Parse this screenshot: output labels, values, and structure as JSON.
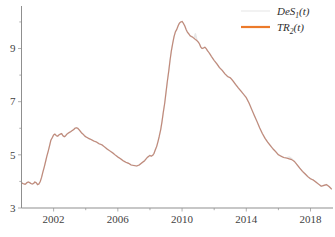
{
  "chart_data": {
    "type": "line",
    "title": "",
    "xlabel": "",
    "ylabel": "",
    "xlim": [
      2000.0,
      2019.4
    ],
    "ylim": [
      3,
      10.6
    ],
    "grid": false,
    "xticks": [
      2002,
      2006,
      2010,
      2014,
      2018
    ],
    "xticklabels": [
      "2002",
      "2006",
      "2010",
      "2014",
      "2018"
    ],
    "xminorticks": [
      2004,
      2008,
      2012,
      2016
    ],
    "yticks": [
      3,
      5,
      7,
      9
    ],
    "yticklabels": [
      "3",
      "5",
      "7",
      "9"
    ],
    "yminorticks": [
      4,
      6,
      8,
      10
    ],
    "legend": {
      "position": "top-right",
      "entries": [
        {
          "name": "DeS",
          "sub": "1",
          "arg": "(t)",
          "color": "#e8e8e8",
          "width": 1.1
        },
        {
          "name": "TR",
          "sub": "2",
          "arg": "(t)",
          "color": "#ec7a2a",
          "width": 2.2
        }
      ]
    },
    "series": [
      {
        "name": "DeS1(t)",
        "color": "#e8e8e8",
        "x": [
          2000.0,
          2000.08,
          2000.17,
          2000.25,
          2000.33,
          2000.42,
          2000.5,
          2000.58,
          2000.67,
          2000.75,
          2000.83,
          2000.92,
          2001.0,
          2001.08,
          2001.17,
          2001.25,
          2001.33,
          2001.42,
          2001.5,
          2001.58,
          2001.67,
          2001.75,
          2001.83,
          2001.92,
          2002.0,
          2002.08,
          2002.17,
          2002.25,
          2002.33,
          2002.42,
          2002.5,
          2002.58,
          2002.67,
          2002.75,
          2002.83,
          2002.92,
          2003.0,
          2003.08,
          2003.17,
          2003.25,
          2003.33,
          2003.42,
          2003.5,
          2003.58,
          2003.67,
          2003.75,
          2003.83,
          2003.92,
          2004.0,
          2004.17,
          2004.33,
          2004.5,
          2004.67,
          2004.83,
          2005.0,
          2005.17,
          2005.33,
          2005.5,
          2005.67,
          2005.83,
          2006.0,
          2006.17,
          2006.33,
          2006.5,
          2006.67,
          2006.83,
          2007.0,
          2007.17,
          2007.33,
          2007.5,
          2007.67,
          2007.83,
          2008.0,
          2008.08,
          2008.17,
          2008.25,
          2008.33,
          2008.42,
          2008.5,
          2008.58,
          2008.67,
          2008.75,
          2008.83,
          2008.92,
          2009.0,
          2009.08,
          2009.17,
          2009.25,
          2009.33,
          2009.42,
          2009.5,
          2009.58,
          2009.67,
          2009.75,
          2009.83,
          2009.92,
          2010.0,
          2010.08,
          2010.17,
          2010.25,
          2010.33,
          2010.42,
          2010.5,
          2010.58,
          2010.67,
          2010.75,
          2010.83,
          2010.92,
          2011.0,
          2011.08,
          2011.17,
          2011.25,
          2011.33,
          2011.42,
          2011.5,
          2011.58,
          2011.67,
          2011.75,
          2011.83,
          2011.92,
          2012.0,
          2012.17,
          2012.33,
          2012.5,
          2012.67,
          2012.83,
          2013.0,
          2013.08,
          2013.17,
          2013.33,
          2013.5,
          2013.67,
          2013.83,
          2014.0,
          2014.17,
          2014.33,
          2014.5,
          2014.67,
          2014.83,
          2015.0,
          2015.17,
          2015.33,
          2015.5,
          2015.67,
          2015.83,
          2016.0,
          2016.17,
          2016.33,
          2016.5,
          2016.67,
          2016.83,
          2017.0,
          2017.17,
          2017.33,
          2017.5,
          2017.67,
          2017.83,
          2018.0,
          2018.17,
          2018.33,
          2018.5,
          2018.67,
          2018.83,
          2019.0,
          2019.17,
          2019.3
        ],
        "y": [
          3.95,
          3.92,
          3.9,
          3.9,
          3.95,
          3.98,
          3.96,
          3.92,
          3.9,
          3.92,
          3.98,
          3.95,
          3.88,
          3.9,
          4.0,
          4.15,
          4.35,
          4.55,
          4.75,
          4.95,
          5.15,
          5.35,
          5.55,
          5.65,
          5.75,
          5.78,
          5.72,
          5.7,
          5.75,
          5.78,
          5.8,
          5.72,
          5.68,
          5.72,
          5.78,
          5.82,
          5.85,
          5.88,
          5.92,
          5.95,
          6.0,
          6.02,
          6.0,
          5.95,
          5.88,
          5.82,
          5.78,
          5.72,
          5.68,
          5.62,
          5.58,
          5.52,
          5.48,
          5.42,
          5.38,
          5.3,
          5.22,
          5.15,
          5.08,
          5.0,
          4.92,
          4.85,
          4.78,
          4.72,
          4.68,
          4.62,
          4.6,
          4.58,
          4.62,
          4.7,
          4.78,
          4.9,
          4.98,
          4.95,
          4.98,
          5.05,
          5.18,
          5.32,
          5.5,
          5.7,
          5.95,
          6.25,
          6.6,
          6.95,
          7.35,
          7.75,
          8.15,
          8.55,
          8.9,
          9.2,
          9.45,
          9.62,
          9.72,
          9.85,
          9.95,
          10.0,
          10.02,
          9.95,
          9.85,
          9.72,
          9.62,
          9.55,
          9.48,
          9.45,
          9.42,
          9.38,
          9.55,
          9.32,
          9.25,
          9.18,
          9.05,
          9.0,
          9.02,
          9.05,
          9.0,
          8.92,
          8.85,
          8.78,
          8.7,
          8.62,
          8.55,
          8.42,
          8.28,
          8.18,
          8.05,
          7.95,
          7.9,
          7.85,
          7.78,
          7.65,
          7.52,
          7.4,
          7.28,
          7.15,
          6.95,
          6.72,
          6.48,
          6.25,
          6.02,
          5.8,
          5.62,
          5.48,
          5.35,
          5.22,
          5.12,
          5.0,
          4.95,
          4.9,
          4.88,
          4.92,
          4.85,
          4.75,
          4.62,
          4.5,
          4.38,
          4.28,
          4.18,
          4.1,
          4.05,
          3.98,
          3.9,
          3.82,
          3.85,
          3.88,
          3.8,
          3.72
        ]
      },
      {
        "name": "TR2(t)",
        "color": "#c08878",
        "x": [
          2000.0,
          2000.08,
          2000.17,
          2000.25,
          2000.33,
          2000.42,
          2000.5,
          2000.58,
          2000.67,
          2000.75,
          2000.83,
          2000.92,
          2001.0,
          2001.08,
          2001.17,
          2001.25,
          2001.33,
          2001.42,
          2001.5,
          2001.58,
          2001.67,
          2001.75,
          2001.83,
          2001.92,
          2002.0,
          2002.08,
          2002.17,
          2002.25,
          2002.33,
          2002.42,
          2002.5,
          2002.58,
          2002.67,
          2002.75,
          2002.83,
          2002.92,
          2003.0,
          2003.08,
          2003.17,
          2003.25,
          2003.33,
          2003.42,
          2003.5,
          2003.58,
          2003.67,
          2003.75,
          2003.83,
          2003.92,
          2004.0,
          2004.17,
          2004.33,
          2004.5,
          2004.67,
          2004.83,
          2005.0,
          2005.17,
          2005.33,
          2005.5,
          2005.67,
          2005.83,
          2006.0,
          2006.17,
          2006.33,
          2006.5,
          2006.67,
          2006.83,
          2007.0,
          2007.17,
          2007.33,
          2007.5,
          2007.67,
          2007.83,
          2008.0,
          2008.08,
          2008.17,
          2008.25,
          2008.33,
          2008.42,
          2008.5,
          2008.58,
          2008.67,
          2008.75,
          2008.83,
          2008.92,
          2009.0,
          2009.08,
          2009.17,
          2009.25,
          2009.33,
          2009.42,
          2009.5,
          2009.58,
          2009.67,
          2009.75,
          2009.83,
          2009.92,
          2010.0,
          2010.08,
          2010.17,
          2010.25,
          2010.33,
          2010.42,
          2010.5,
          2010.58,
          2010.67,
          2010.75,
          2010.83,
          2010.92,
          2011.0,
          2011.08,
          2011.17,
          2011.25,
          2011.33,
          2011.42,
          2011.5,
          2011.58,
          2011.67,
          2011.75,
          2011.83,
          2011.92,
          2012.0,
          2012.17,
          2012.33,
          2012.5,
          2012.67,
          2012.83,
          2013.0,
          2013.08,
          2013.17,
          2013.33,
          2013.5,
          2013.67,
          2013.83,
          2014.0,
          2014.17,
          2014.33,
          2014.5,
          2014.67,
          2014.83,
          2015.0,
          2015.17,
          2015.33,
          2015.5,
          2015.67,
          2015.83,
          2016.0,
          2016.17,
          2016.33,
          2016.5,
          2016.67,
          2016.83,
          2017.0,
          2017.17,
          2017.33,
          2017.5,
          2017.67,
          2017.83,
          2018.0,
          2018.17,
          2018.33,
          2018.5,
          2018.67,
          2018.83,
          2019.0,
          2019.17,
          2019.3
        ],
        "y": [
          3.95,
          3.92,
          3.9,
          3.9,
          3.95,
          3.98,
          3.96,
          3.92,
          3.9,
          3.92,
          3.98,
          3.95,
          3.88,
          3.9,
          4.0,
          4.15,
          4.35,
          4.55,
          4.75,
          4.95,
          5.15,
          5.35,
          5.55,
          5.65,
          5.75,
          5.78,
          5.72,
          5.7,
          5.75,
          5.78,
          5.8,
          5.72,
          5.68,
          5.72,
          5.78,
          5.82,
          5.85,
          5.88,
          5.92,
          5.95,
          6.0,
          6.02,
          6.0,
          5.95,
          5.88,
          5.82,
          5.78,
          5.72,
          5.68,
          5.62,
          5.58,
          5.52,
          5.48,
          5.42,
          5.38,
          5.3,
          5.22,
          5.15,
          5.08,
          5.0,
          4.92,
          4.85,
          4.78,
          4.72,
          4.68,
          4.62,
          4.6,
          4.58,
          4.62,
          4.7,
          4.78,
          4.9,
          4.98,
          4.95,
          4.98,
          5.05,
          5.18,
          5.32,
          5.5,
          5.7,
          5.95,
          6.25,
          6.6,
          6.95,
          7.35,
          7.75,
          8.15,
          8.55,
          8.9,
          9.2,
          9.45,
          9.62,
          9.72,
          9.85,
          9.95,
          10.0,
          10.02,
          9.95,
          9.85,
          9.72,
          9.62,
          9.55,
          9.48,
          9.45,
          9.42,
          9.38,
          9.34,
          9.3,
          9.25,
          9.18,
          9.05,
          9.0,
          9.02,
          9.05,
          9.0,
          8.92,
          8.85,
          8.78,
          8.7,
          8.62,
          8.55,
          8.42,
          8.28,
          8.18,
          8.05,
          7.95,
          7.9,
          7.85,
          7.78,
          7.65,
          7.52,
          7.4,
          7.28,
          7.15,
          6.95,
          6.72,
          6.48,
          6.25,
          6.02,
          5.8,
          5.62,
          5.48,
          5.35,
          5.22,
          5.12,
          5.0,
          4.95,
          4.9,
          4.88,
          4.85,
          4.82,
          4.75,
          4.62,
          4.5,
          4.38,
          4.28,
          4.18,
          4.1,
          4.05,
          3.98,
          3.9,
          3.82,
          3.85,
          3.88,
          3.8,
          3.72
        ]
      }
    ]
  },
  "caption": {
    "text": ""
  }
}
